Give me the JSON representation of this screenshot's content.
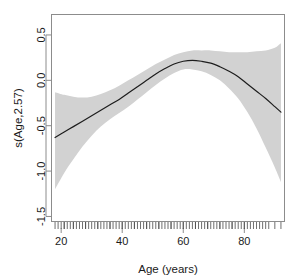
{
  "chart_data": {
    "type": "line",
    "title": "",
    "subtitle": "",
    "xlabel": "Age (years)",
    "ylabel": "s(Age,2.57)",
    "xlim": [
      17,
      93
    ],
    "ylim": [
      -1.55,
      0.72
    ],
    "xticks": [
      20,
      40,
      60,
      80
    ],
    "xtick_labels": [
      "20",
      "40",
      "60",
      "80"
    ],
    "yticks": [
      0.5,
      0.0,
      -0.5,
      -1.0,
      -1.5
    ],
    "ytick_labels": [
      "0.5",
      "0.0",
      "-0.5",
      "-1.0",
      "-1.5"
    ],
    "grid": false,
    "legend": "none",
    "colors": {
      "fit_line": "#1d1d1d",
      "ci_band": "#d2d2d2",
      "axis": "#8c8c8c",
      "text": "#1a1a1a",
      "background": "#ffffff"
    },
    "series": [
      {
        "name": "s(Age,2.57) fit",
        "x": [
          18,
          21,
          24,
          27,
          30,
          33,
          36,
          39,
          42,
          45,
          48,
          51,
          54,
          57,
          60,
          63,
          66,
          69,
          72,
          75,
          78,
          81,
          84,
          87,
          90,
          92
        ],
        "values": [
          -0.63,
          -0.57,
          -0.51,
          -0.45,
          -0.39,
          -0.33,
          -0.27,
          -0.21,
          -0.14,
          -0.07,
          0.0,
          0.07,
          0.13,
          0.18,
          0.21,
          0.22,
          0.21,
          0.19,
          0.15,
          0.1,
          0.04,
          -0.04,
          -0.12,
          -0.2,
          -0.29,
          -0.35
        ]
      },
      {
        "name": "upper 95% CI",
        "x": [
          18,
          21,
          24,
          27,
          30,
          33,
          36,
          39,
          42,
          45,
          48,
          51,
          54,
          57,
          60,
          63,
          66,
          69,
          72,
          75,
          78,
          81,
          84,
          87,
          90,
          92
        ],
        "values": [
          -0.13,
          -0.16,
          -0.18,
          -0.19,
          -0.18,
          -0.15,
          -0.11,
          -0.06,
          0.0,
          0.06,
          0.12,
          0.18,
          0.23,
          0.28,
          0.31,
          0.33,
          0.33,
          0.33,
          0.32,
          0.31,
          0.31,
          0.31,
          0.32,
          0.33,
          0.36,
          0.41
        ]
      },
      {
        "name": "lower 95% CI",
        "x": [
          18,
          21,
          24,
          27,
          30,
          33,
          36,
          39,
          42,
          45,
          48,
          51,
          54,
          57,
          60,
          63,
          66,
          69,
          72,
          75,
          78,
          81,
          84,
          87,
          90,
          92
        ],
        "values": [
          -1.2,
          -1.02,
          -0.87,
          -0.73,
          -0.61,
          -0.51,
          -0.43,
          -0.36,
          -0.29,
          -0.21,
          -0.13,
          -0.05,
          0.02,
          0.08,
          0.12,
          0.12,
          0.1,
          0.06,
          0.0,
          -0.09,
          -0.2,
          -0.35,
          -0.53,
          -0.74,
          -0.96,
          -1.12
        ]
      }
    ],
    "rug": {
      "name": "data rug ticks",
      "x": [
        18,
        19,
        20,
        21,
        21,
        22,
        23,
        24,
        24,
        25,
        26,
        27,
        28,
        28,
        29,
        30,
        31,
        32,
        32,
        33,
        34,
        35,
        36,
        36,
        37,
        38,
        39,
        40,
        40,
        41,
        42,
        43,
        44,
        44,
        45,
        46,
        47,
        48,
        48,
        49,
        50,
        51,
        52,
        52,
        53,
        54,
        55,
        56,
        56,
        57,
        58,
        59,
        60,
        60,
        61,
        62,
        63,
        64,
        64,
        65,
        66,
        67,
        68,
        68,
        69,
        70,
        71,
        72,
        72,
        73,
        74,
        75,
        76,
        76,
        77,
        78,
        79,
        80,
        80,
        81,
        82,
        83,
        84,
        85,
        86,
        87,
        88,
        90,
        92
      ]
    }
  },
  "axes": {
    "y_title": "s(Age,2.57)",
    "x_title": "Age (years)"
  }
}
